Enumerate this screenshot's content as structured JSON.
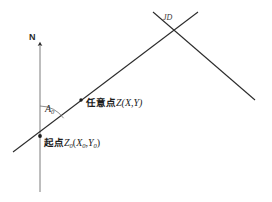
{
  "figure": {
    "background_color": "#ffffff",
    "stroke_color": "#2b2b2b",
    "labels": {
      "north": "N",
      "azimuth_symbol": "A",
      "azimuth_subscript": "0",
      "intersection": "JD",
      "arbitrary_point_cjk": "任意点",
      "arbitrary_point_symbol": "Z",
      "arbitrary_point_coords": "(X,Y)",
      "start_point_cjk": "起点",
      "start_point_symbol": "Z",
      "start_point_subscript": "0",
      "start_point_coords_open": "(",
      "start_point_coord_x": "X",
      "start_point_coord_x_sub": "0",
      "start_point_coord_sep": ",",
      "start_point_coord_y": "Y",
      "start_point_coord_y_sub": "0",
      "start_point_coords_close": ")"
    },
    "geometry": {
      "north_axis": {
        "x": 40,
        "y_top": 42,
        "y_bottom": 192
      },
      "ascending_line": {
        "x1": 13,
        "y1": 152,
        "x2": 198,
        "y2": 12
      },
      "descending_line": {
        "x1": 153,
        "y1": 12,
        "x2": 255,
        "y2": 100
      },
      "start_point": {
        "x": 40,
        "y": 136
      },
      "arbitrary_point": {
        "x": 81,
        "y": 100
      },
      "intersection_point": {
        "x": 172,
        "y": 30
      },
      "angle_arc_radius": 30
    }
  }
}
